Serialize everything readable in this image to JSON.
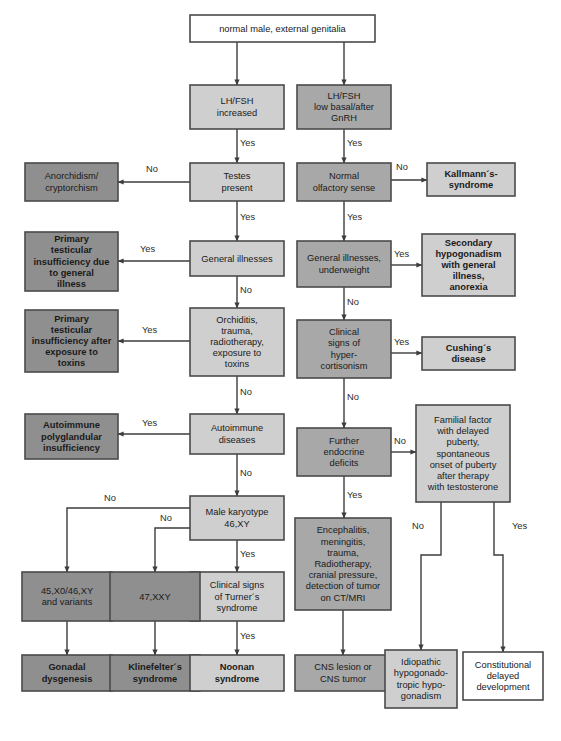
{
  "figure": {
    "caption_bold": "Fig.",
    "caption_rest": "",
    "width": 561,
    "height": 741
  },
  "palette": {
    "white": "#ffffff",
    "light_gray": "#cfcfcf",
    "medium_gray": "#a8a8a8",
    "dark_gray": "#8f8f8f",
    "border": "#4a4a4a",
    "line": "#3c3c3c",
    "text": "#1a1a1a"
  },
  "edge_labels": {
    "yes": "Yes",
    "no": "No"
  },
  "nodes": [
    {
      "id": "root",
      "name": "node-normal-male-external-genitalia",
      "lines": [
        "normal male, external genitalia"
      ],
      "x": 190,
      "y": 15,
      "w": 185,
      "h": 27,
      "fill": "#ffffff",
      "bold": false
    },
    {
      "id": "lh_fsh_increased",
      "name": "node-lh-fsh-increased",
      "lines": [
        "LH/FSH",
        "increased"
      ],
      "x": 190,
      "y": 85,
      "w": 94,
      "h": 44,
      "fill": "#cfcfcf",
      "bold": false
    },
    {
      "id": "lh_fsh_low",
      "name": "node-lh-fsh-low-basal-after-gnrh",
      "lines": [
        "LH/FSH",
        "low basal/after",
        "GnRH"
      ],
      "x": 297,
      "y": 85,
      "w": 94,
      "h": 44,
      "fill": "#a8a8a8",
      "bold": false
    },
    {
      "id": "testes_present",
      "name": "node-testes-present",
      "lines": [
        "Testes",
        "present"
      ],
      "x": 190,
      "y": 163,
      "w": 94,
      "h": 38,
      "fill": "#cfcfcf",
      "bold": false
    },
    {
      "id": "anorchidism",
      "name": "node-anorchidism-cryptorchism",
      "lines": [
        "Anorchidism/",
        "cryptorchism"
      ],
      "x": 25,
      "y": 163,
      "w": 93,
      "h": 38,
      "fill": "#8f8f8f",
      "bold": false
    },
    {
      "id": "normal_olfactory",
      "name": "node-normal-olfactory-sense",
      "lines": [
        "Normal",
        "olfactory sense"
      ],
      "x": 297,
      "y": 163,
      "w": 94,
      "h": 38,
      "fill": "#a8a8a8",
      "bold": false
    },
    {
      "id": "kallmann",
      "name": "node-kallmanns-syndrome",
      "lines": [
        "Kallmann´s-",
        "syndrome"
      ],
      "x": 427,
      "y": 163,
      "w": 88,
      "h": 33,
      "fill": "#cfcfcf",
      "bold": true
    },
    {
      "id": "general_illnesses",
      "name": "node-general-illnesses",
      "lines": [
        "General illnesses"
      ],
      "x": 190,
      "y": 241,
      "w": 94,
      "h": 35,
      "fill": "#cfcfcf",
      "bold": false
    },
    {
      "id": "primary_ti_general",
      "name": "node-primary-testicular-insufficiency-general-illness",
      "lines": [
        "Primary",
        "testicular",
        "insufficiency due",
        "to general",
        "illness"
      ],
      "x": 25,
      "y": 232,
      "w": 93,
      "h": 59,
      "fill": "#8f8f8f",
      "bold": true
    },
    {
      "id": "general_illnesses_uw",
      "name": "node-general-illnesses-underweight",
      "lines": [
        "General illnesses,",
        "underweight"
      ],
      "x": 297,
      "y": 241,
      "w": 94,
      "h": 46,
      "fill": "#a8a8a8",
      "bold": false
    },
    {
      "id": "secondary_hypo",
      "name": "node-secondary-hypogonadism-general-illness-anorexia",
      "lines": [
        "Secondary",
        "hypogonadism",
        "with general",
        "illness,",
        "anorexia"
      ],
      "x": 422,
      "y": 234,
      "w": 93,
      "h": 62,
      "fill": "#cfcfcf",
      "bold": true
    },
    {
      "id": "orchiditis",
      "name": "node-orchiditis-trauma-radiotherapy-toxins",
      "lines": [
        "Orchiditis,",
        "trauma,",
        "radiotherapy,",
        "exposure to",
        "toxins"
      ],
      "x": 190,
      "y": 308,
      "w": 94,
      "h": 68,
      "fill": "#cfcfcf",
      "bold": false
    },
    {
      "id": "primary_ti_toxins",
      "name": "node-primary-testicular-insufficiency-toxins",
      "lines": [
        "Primary",
        "testicular",
        "insufficiency after",
        "exposure to",
        "toxins"
      ],
      "x": 25,
      "y": 310,
      "w": 93,
      "h": 62,
      "fill": "#8f8f8f",
      "bold": true
    },
    {
      "id": "clinical_hyper",
      "name": "node-clinical-signs-hypercortisonism",
      "lines": [
        "Clinical",
        "signs of",
        "hyper-",
        "cortisonism"
      ],
      "x": 297,
      "y": 320,
      "w": 94,
      "h": 58,
      "fill": "#a8a8a8",
      "bold": false
    },
    {
      "id": "cushings",
      "name": "node-cushings-disease",
      "lines": [
        "Cushing´s",
        "disease"
      ],
      "x": 422,
      "y": 337,
      "w": 93,
      "h": 33,
      "fill": "#cfcfcf",
      "bold": true
    },
    {
      "id": "autoimmune_diseases",
      "name": "node-autoimmune-diseases",
      "lines": [
        "Autoimmune",
        "diseases"
      ],
      "x": 190,
      "y": 414,
      "w": 94,
      "h": 40,
      "fill": "#cfcfcf",
      "bold": false
    },
    {
      "id": "autoimmune_poly",
      "name": "node-autoimmune-polyglandular-insufficiency",
      "lines": [
        "Autoimmune",
        "polyglandular",
        "insufficiency"
      ],
      "x": 25,
      "y": 414,
      "w": 93,
      "h": 45,
      "fill": "#8f8f8f",
      "bold": true
    },
    {
      "id": "further_endocrine",
      "name": "node-further-endocrine-deficits",
      "lines": [
        "Further",
        "endocrine",
        "deficits"
      ],
      "x": 297,
      "y": 428,
      "w": 94,
      "h": 48,
      "fill": "#a8a8a8",
      "bold": false
    },
    {
      "id": "familial_factor",
      "name": "node-familial-factor-delayed-puberty",
      "lines": [
        "Familial factor",
        "with delayed",
        "puberty,",
        "spontaneous",
        "onset of puberty",
        "after therapy",
        "with testosterone"
      ],
      "x": 416,
      "y": 405,
      "w": 94,
      "h": 97,
      "fill": "#cfcfcf",
      "bold": false
    },
    {
      "id": "male_karyotype",
      "name": "node-male-karyotype-46-xy",
      "lines": [
        "Male karyotype",
        "46,XY"
      ],
      "x": 190,
      "y": 496,
      "w": 94,
      "h": 44,
      "fill": "#cfcfcf",
      "bold": false
    },
    {
      "id": "encephalitis",
      "name": "node-encephalitis-meningitis-trauma-ct-mri",
      "lines": [
        "Encephalitis,",
        "meningitis,",
        "trauma,",
        "Radiotherapy,",
        "cranial pressure,",
        "detection of tumor",
        "on CT/MRI"
      ],
      "x": 295,
      "y": 518,
      "w": 96,
      "h": 92,
      "fill": "#a8a8a8",
      "bold": false
    },
    {
      "id": "turner_signs",
      "name": "node-clinical-signs-turners-syndrome",
      "lines": [
        "Clinical signs",
        "of Turner´s",
        "syndrome"
      ],
      "x": 190,
      "y": 572,
      "w": 94,
      "h": 49,
      "fill": "#cfcfcf",
      "bold": false
    },
    {
      "id": "karyotype_45x0",
      "name": "node-45-x0-46-xy-and-variants",
      "lines": [
        "45,X0/46,XY",
        "and variants"
      ],
      "x": 22,
      "y": 572,
      "w": 90,
      "h": 49,
      "fill": "#8f8f8f",
      "bold": false
    },
    {
      "id": "karyotype_47xxy",
      "name": "node-47-xxy",
      "lines": [
        "47,XXY"
      ],
      "x": 110,
      "y": 572,
      "w": 90,
      "h": 49,
      "fill": "#8f8f8f",
      "bold": false
    },
    {
      "id": "gonadal_dysgenesis",
      "name": "node-gonadal-dysgenesis",
      "lines": [
        "Gonadal",
        "dysgenesis"
      ],
      "x": 22,
      "y": 655,
      "w": 90,
      "h": 36,
      "fill": "#8f8f8f",
      "bold": true
    },
    {
      "id": "klinefelter",
      "name": "node-klinefelters-syndrome",
      "lines": [
        "Klinefelter´s",
        "syndrome"
      ],
      "x": 110,
      "y": 655,
      "w": 90,
      "h": 36,
      "fill": "#8f8f8f",
      "bold": true
    },
    {
      "id": "noonan",
      "name": "node-noonan-syndrome",
      "lines": [
        "Noonan",
        "syndrome"
      ],
      "x": 190,
      "y": 655,
      "w": 94,
      "h": 36,
      "fill": "#cfcfcf",
      "bold": true
    },
    {
      "id": "cns_lesion",
      "name": "node-cns-lesion-or-cns-tumor",
      "lines": [
        "CNS lesion or",
        "CNS tumor"
      ],
      "x": 295,
      "y": 655,
      "w": 96,
      "h": 36,
      "fill": "#a8a8a8",
      "bold": false
    },
    {
      "id": "idiopathic_hh",
      "name": "node-idiopathic-hypogonadotropic-hypogonadism",
      "lines": [
        "Idiopathic",
        "hypogonado-",
        "tropic hypo-",
        "gonadism"
      ],
      "x": 385,
      "y": 650,
      "w": 72,
      "h": 58,
      "fill": "#cfcfcf",
      "bold": false
    },
    {
      "id": "constitutional_delay",
      "name": "node-constitutional-delayed-development",
      "lines": [
        "Constitutional",
        "delayed",
        "development"
      ],
      "x": 463,
      "y": 652,
      "w": 80,
      "h": 48,
      "fill": "#ffffff",
      "bold": false
    }
  ],
  "edges": [
    {
      "name": "edge-root-to-lh-fsh-increased",
      "points": "237,42 237,85",
      "arrow": true,
      "label": "",
      "lx": 0,
      "ly": 0
    },
    {
      "name": "edge-root-to-lh-fsh-low",
      "points": "344,42 344,85",
      "arrow": true,
      "label": "",
      "lx": 0,
      "ly": 0
    },
    {
      "name": "edge-lh-fsh-increased-to-testes",
      "points": "237,129 237,163",
      "arrow": true,
      "label": "Yes",
      "lx": 240,
      "ly": 146
    },
    {
      "name": "edge-lh-fsh-low-to-olfactory",
      "points": "344,129 344,163",
      "arrow": true,
      "label": "Yes",
      "lx": 347,
      "ly": 146
    },
    {
      "name": "edge-testes-to-anorchidism",
      "points": "190,182 118,182",
      "arrow": true,
      "label": "No",
      "lx": 146,
      "ly": 172
    },
    {
      "name": "edge-olfactory-to-kallmann",
      "points": "391,180 427,180",
      "arrow": true,
      "label": "No",
      "lx": 396,
      "ly": 170
    },
    {
      "name": "edge-testes-to-general-illnesses",
      "points": "237,201 237,241",
      "arrow": true,
      "label": "Yes",
      "lx": 240,
      "ly": 220
    },
    {
      "name": "edge-olfactory-to-general-illnesses-uw",
      "points": "344,201 344,241",
      "arrow": true,
      "label": "Yes",
      "lx": 347,
      "ly": 220
    },
    {
      "name": "edge-general-illnesses-to-primary-ti",
      "points": "190,261 118,261",
      "arrow": true,
      "label": "Yes",
      "lx": 140,
      "ly": 252
    },
    {
      "name": "edge-general-illnesses-uw-to-secondary",
      "points": "391,265 422,265",
      "arrow": true,
      "label": "Yes",
      "lx": 394,
      "ly": 257
    },
    {
      "name": "edge-general-illnesses-to-orchiditis",
      "points": "237,276 237,308",
      "arrow": true,
      "label": "No",
      "lx": 240,
      "ly": 293
    },
    {
      "name": "edge-general-illnesses-uw-to-clinical-hyper",
      "points": "344,287 344,320",
      "arrow": true,
      "label": "No",
      "lx": 347,
      "ly": 305
    },
    {
      "name": "edge-orchiditis-to-primary-ti-toxins",
      "points": "190,341 118,341",
      "arrow": true,
      "label": "Yes",
      "lx": 142,
      "ly": 333
    },
    {
      "name": "edge-clinical-hyper-to-cushings",
      "points": "391,353 422,353",
      "arrow": true,
      "label": "Yes",
      "lx": 394,
      "ly": 345
    },
    {
      "name": "edge-orchiditis-to-autoimmune",
      "points": "237,376 237,414",
      "arrow": true,
      "label": "No",
      "lx": 240,
      "ly": 395
    },
    {
      "name": "edge-clinical-hyper-to-further-endocrine",
      "points": "344,378 344,428",
      "arrow": true,
      "label": "No",
      "lx": 347,
      "ly": 400
    },
    {
      "name": "edge-autoimmune-to-polyglandular",
      "points": "190,434 118,434",
      "arrow": true,
      "label": "Yes",
      "lx": 142,
      "ly": 426
    },
    {
      "name": "edge-further-endocrine-to-familial",
      "points": "391,452 416,452",
      "arrow": true,
      "label": "No",
      "lx": 394,
      "ly": 444
    },
    {
      "name": "edge-autoimmune-to-karyotype",
      "points": "237,454 237,496",
      "arrow": true,
      "label": "No",
      "lx": 240,
      "ly": 476
    },
    {
      "name": "edge-further-endocrine-to-encephalitis",
      "points": "344,476 344,518",
      "arrow": true,
      "label": "Yes",
      "lx": 347,
      "ly": 498
    },
    {
      "name": "edge-karyotype-no-to-45x0",
      "points": "190,508 67,508 67,572",
      "arrow": true,
      "label": "No",
      "lx": 104,
      "ly": 501
    },
    {
      "name": "edge-karyotype-no-to-47xxy",
      "points": "190,528 155,528 155,572",
      "arrow": true,
      "label": "No",
      "lx": 160,
      "ly": 521
    },
    {
      "name": "edge-karyotype-to-turner",
      "points": "237,540 237,572",
      "arrow": true,
      "label": "Yes",
      "lx": 240,
      "ly": 557
    },
    {
      "name": "edge-45x0-to-gonadal",
      "points": "67,621 67,655",
      "arrow": true,
      "label": "",
      "lx": 0,
      "ly": 0
    },
    {
      "name": "edge-47xxy-to-klinefelter",
      "points": "155,621 155,655",
      "arrow": true,
      "label": "",
      "lx": 0,
      "ly": 0
    },
    {
      "name": "edge-turner-to-noonan",
      "points": "237,621 237,655",
      "arrow": true,
      "label": "Yes",
      "lx": 240,
      "ly": 639
    },
    {
      "name": "edge-encephalitis-to-cns-lesion",
      "points": "343,610 343,655",
      "arrow": true,
      "label": "",
      "lx": 0,
      "ly": 0
    },
    {
      "name": "edge-familial-no-to-idiopathic",
      "points": "441,502 441,555 421,555 421,650",
      "arrow": true,
      "label": "No",
      "lx": 412,
      "ly": 529
    },
    {
      "name": "edge-familial-yes-to-constitutional",
      "points": "494,502 494,555 503,555 503,652",
      "arrow": true,
      "label": "Yes",
      "lx": 512,
      "ly": 529
    }
  ]
}
